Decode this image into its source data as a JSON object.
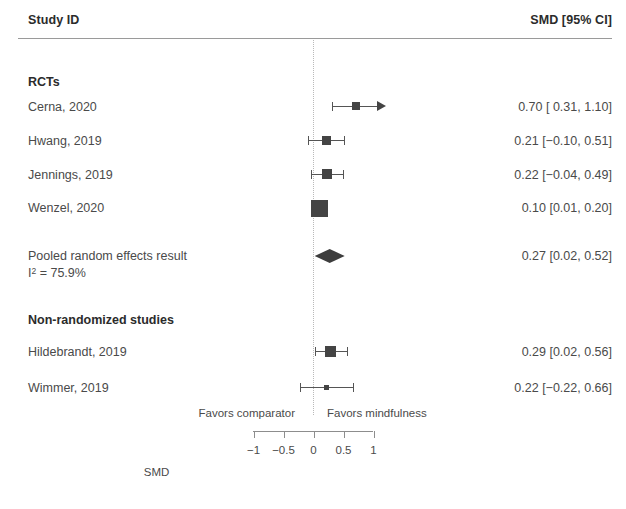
{
  "header": {
    "study_col": "Study ID",
    "estimate_col": "SMD [95% CI]"
  },
  "axis": {
    "title": "SMD",
    "tick_labels": [
      "−1",
      "−0.5",
      "0",
      "0.5",
      "1"
    ],
    "tick_values": [
      -1,
      -0.5,
      0,
      0.5,
      1
    ],
    "favors_left": "Favors comparator",
    "favors_right": "Favors mindfulness",
    "zero_reference": 0
  },
  "groups": [
    {
      "heading": "RCTs",
      "rows": [
        {
          "study": "Cerna, 2020",
          "estimate_text": "0.70 [ 0.31, 1.10]",
          "est": 0.7,
          "lower": 0.31,
          "upper": 1.1,
          "truncated_right": true,
          "box": 8
        },
        {
          "study": "Hwang, 2019",
          "estimate_text": "0.21 [−0.10, 0.51]",
          "est": 0.21,
          "lower": -0.1,
          "upper": 0.51,
          "truncated_right": false,
          "box": 9
        },
        {
          "study": "Jennings, 2019",
          "estimate_text": "0.22 [−0.04, 0.49]",
          "est": 0.22,
          "lower": -0.04,
          "upper": 0.49,
          "truncated_right": false,
          "box": 10
        },
        {
          "study": "Wenzel, 2020",
          "estimate_text": "0.10 [0.01, 0.20]",
          "est": 0.1,
          "lower": 0.01,
          "upper": 0.2,
          "truncated_right": false,
          "box": 17
        }
      ]
    },
    {
      "heading": "Non-randomized studies",
      "rows": [
        {
          "study": "Hildebrandt, 2019",
          "estimate_text": "0.29 [0.02, 0.56]",
          "est": 0.29,
          "lower": 0.02,
          "upper": 0.56,
          "truncated_right": false,
          "box": 11
        },
        {
          "study": "Wimmer, 2019",
          "estimate_text": "0.22 [−0.22, 0.66]",
          "est": 0.22,
          "lower": -0.22,
          "upper": 0.66,
          "truncated_right": false,
          "box": 5
        }
      ]
    }
  ],
  "pooled": {
    "label": "Pooled random effects result",
    "heterogeneity_prefix": "I",
    "heterogeneity_sup": "2",
    "heterogeneity_value": " = 75.9%",
    "estimate_text": "0.27 [0.02, 0.52]",
    "est": 0.27,
    "lower": 0.02,
    "upper": 0.52
  },
  "chart_data": {
    "type": "forest",
    "title": "",
    "xlabel": "SMD",
    "ylabel": "",
    "xlim": [
      -1.15,
      1.15
    ],
    "xticks": [
      -1,
      -0.5,
      0,
      0.5,
      1
    ],
    "grid": false,
    "zero_line": 0,
    "effect_measure": "SMD",
    "ci_level": "95%",
    "left_favors": "Favors comparator",
    "right_favors": "Favors mindfulness",
    "subgroups": [
      {
        "name": "RCTs",
        "studies": [
          {
            "label": "Cerna, 2020",
            "estimate": 0.7,
            "ci_lower": 0.31,
            "ci_upper": 1.1
          },
          {
            "label": "Hwang, 2019",
            "estimate": 0.21,
            "ci_lower": -0.1,
            "ci_upper": 0.51
          },
          {
            "label": "Jennings, 2019",
            "estimate": 0.22,
            "ci_lower": -0.04,
            "ci_upper": 0.49
          },
          {
            "label": "Wenzel, 2020",
            "estimate": 0.1,
            "ci_lower": 0.01,
            "ci_upper": 0.2
          }
        ]
      },
      {
        "name": "Non-randomized studies",
        "studies": [
          {
            "label": "Hildebrandt, 2019",
            "estimate": 0.29,
            "ci_lower": 0.02,
            "ci_upper": 0.56
          },
          {
            "label": "Wimmer, 2019",
            "estimate": 0.22,
            "ci_lower": -0.22,
            "ci_upper": 0.66
          }
        ]
      }
    ],
    "summary": {
      "label": "Pooled random effects result",
      "estimate": 0.27,
      "ci_lower": 0.02,
      "ci_upper": 0.52,
      "i_squared": 75.9
    }
  },
  "colors": {
    "marker": "#444444",
    "line": "#555555",
    "rule": "#9a9a9a",
    "zero_line": "#b9b9b9",
    "text": "#4a4a4a",
    "background": "#ffffff"
  }
}
